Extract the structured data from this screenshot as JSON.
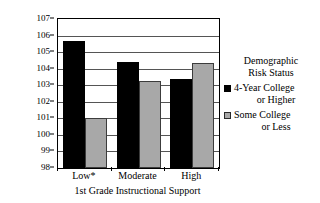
{
  "chart_data": {
    "type": "bar",
    "title": "",
    "xlabel": "1st Grade Instructional Support",
    "ylabel": "Woodcock Johnson 1st Grade Composites-Adjusted Marginal Means",
    "ylabel_lines": [
      "Woodcock Johnson 1st Grade",
      "Composites-Adjusted Marginal Means"
    ],
    "categories": [
      "Low*",
      "Moderate",
      "High"
    ],
    "series": [
      {
        "name": "4-Year College or Higher",
        "color": "#000000",
        "values": [
          105.7,
          104.4,
          103.4
        ]
      },
      {
        "name": "Some College or Less",
        "color": "#a8a8a8",
        "values": [
          101.0,
          103.25,
          104.35
        ]
      }
    ],
    "ylim": [
      98,
      107
    ],
    "yticks": [
      107,
      106,
      105,
      104,
      103,
      102,
      101,
      100,
      99,
      98
    ],
    "ytick_labels": [
      "107",
      "106",
      "105",
      "104",
      "103",
      "102",
      "101",
      "100",
      "99",
      "98"
    ],
    "grid": true,
    "legend_position": "right"
  },
  "legend": {
    "title_line_1": "Demographic",
    "title_line_2": "Risk Status",
    "entries": [
      {
        "swatch": "dark",
        "line_1": "4-Year College",
        "line_2": "or Higher"
      },
      {
        "swatch": "light",
        "line_1": "Some College",
        "line_2": "or Less"
      }
    ]
  }
}
